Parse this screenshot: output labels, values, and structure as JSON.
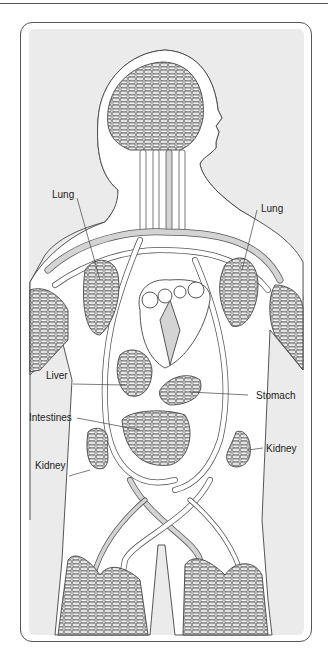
{
  "figure": {
    "labels": {
      "lung_left": "Lung",
      "lung_right": "Lung",
      "liver": "Liver",
      "stomach": "Stomach",
      "intestines": "Intestines",
      "kidney_left": "Kidney",
      "kidney_right": "Kidney"
    },
    "colors": {
      "background": "#ebebeb",
      "body": "#ffffff",
      "outline": "#444444",
      "vessel_fill": "#d4d4d4",
      "capillary": "#555555"
    }
  }
}
